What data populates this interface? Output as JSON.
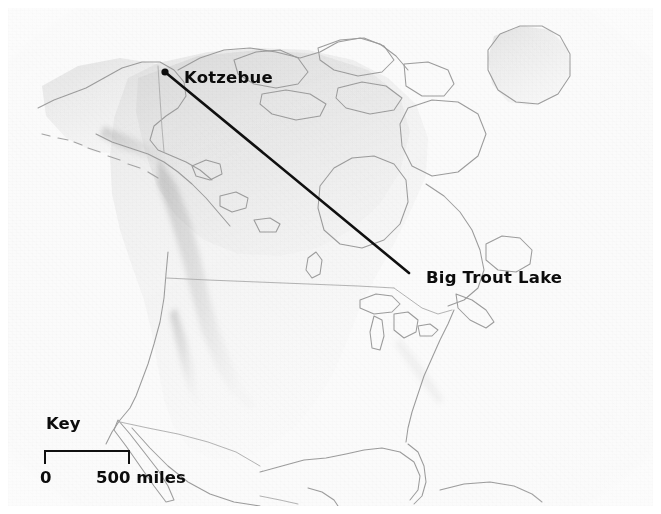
{
  "map": {
    "title": "Great-circle route map of North America",
    "background_color": "#f5f5f5",
    "ocean_color": "#fbfbfb",
    "land_color": "#efefef",
    "coastline_color": "#9a9a9a",
    "border_color": "#b4b4b4",
    "route_color": "#101010",
    "label_color": "#0c0c0c"
  },
  "places": [
    {
      "id": "kotzebue",
      "label": "Kotzebue",
      "marker": "city-dot",
      "marker_x": 165,
      "marker_y": 72,
      "label_x": 176,
      "label_y": 62
    },
    {
      "id": "big-trout-lake",
      "label": "Big Trout Lake",
      "marker": "route-endpoint",
      "marker_x": 409,
      "marker_y": 273,
      "label_x": 418,
      "label_y": 262
    }
  ],
  "route": {
    "name": "great-circle-route",
    "from": "Kotzebue",
    "to": "Big Trout Lake",
    "start_x": 165,
    "start_y": 72,
    "end_x": 409,
    "end_y": 273,
    "stroke_width": 2.6,
    "color": "#101010"
  },
  "key": {
    "title": "Key",
    "scale": {
      "min_label": "0",
      "max_label": "500 miles",
      "value": 500,
      "unit": "miles",
      "bar_width_px": 86
    }
  }
}
